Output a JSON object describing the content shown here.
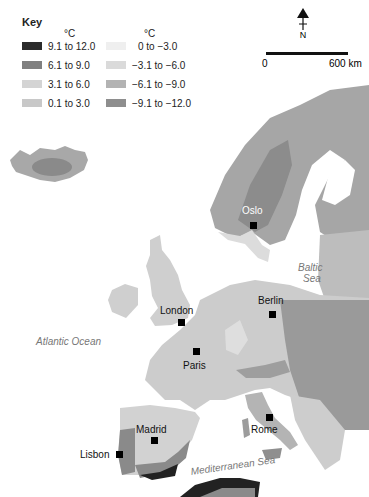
{
  "key": {
    "title": "Key",
    "unit_left": "°C",
    "unit_right": "°C",
    "items_left": [
      {
        "label": "9.1 to 12.0",
        "color": "#2b2b2b"
      },
      {
        "label": "6.1 to 9.0",
        "color": "#808080"
      },
      {
        "label": "3.1 to 6.0",
        "color": "#d4d4d4"
      },
      {
        "label": "0.1 to 3.0",
        "color": "#c8c8c8"
      }
    ],
    "items_right": [
      {
        "label": "0 to −3.0",
        "color": "#efefef"
      },
      {
        "label": "−3.1 to −6.0",
        "color": "#dadada"
      },
      {
        "label": "−6.1 to −9.0",
        "color": "#b3b3b3"
      },
      {
        "label": "−9.1 to −12.0",
        "color": "#8e8e8e"
      }
    ]
  },
  "compass": {
    "label": "N"
  },
  "scale": {
    "start": "0",
    "end": "600 km"
  },
  "cities": [
    {
      "name": "Oslo",
      "x": 242,
      "y": 205,
      "mx": 250,
      "my": 222,
      "light": true
    },
    {
      "name": "London",
      "x": 160,
      "y": 305,
      "mx": 178,
      "my": 319,
      "light": false
    },
    {
      "name": "Berlin",
      "x": 258,
      "y": 295,
      "mx": 269,
      "my": 311,
      "light": false
    },
    {
      "name": "Paris",
      "x": 183,
      "y": 360,
      "mx": 193,
      "my": 348,
      "light": false
    },
    {
      "name": "Madrid",
      "x": 136,
      "y": 427,
      "mx": 151,
      "my": 437,
      "light": false
    },
    {
      "name": "Rome",
      "x": 251,
      "y": 424,
      "mx": 266,
      "my": 414,
      "light": false
    },
    {
      "name": "Lisbon",
      "x": 80,
      "y": 451,
      "mx": 116,
      "my": 451,
      "light": false
    }
  ],
  "seas": [
    {
      "name": "Atlantic Ocean",
      "x": 36,
      "y": 336
    },
    {
      "name": "Baltic",
      "x": 298,
      "y": 264
    },
    {
      "name": "Sea",
      "x": 302,
      "y": 275
    },
    {
      "name": "Mediterranean Sea",
      "x": 190,
      "y": 470,
      "rotate": -8
    }
  ]
}
